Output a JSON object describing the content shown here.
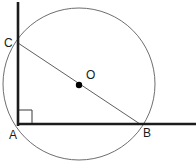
{
  "diagram": {
    "background_color": "#ffffff",
    "stroke_colors": {
      "circle": "#6e6e72",
      "hypotenuse": "#5f5f63",
      "axis_line": "#1c1c1c",
      "right_angle_mark": "#3a3a3e",
      "center_dot": "#000000",
      "label_text": "#1a1a1a"
    },
    "circle": {
      "center_x": 79,
      "center_y": 84,
      "radius": 76
    },
    "center_point": {
      "label": "O",
      "dot_x": 79,
      "dot_y": 85,
      "dot_radius": 3.2,
      "label_x": 86,
      "label_y": 79
    },
    "points": [
      {
        "name": "point-c",
        "label": "C",
        "x": 18,
        "y": 43,
        "label_x": 4,
        "label_y": 47
      },
      {
        "name": "point-a",
        "label": "A",
        "x": 18,
        "y": 124,
        "label_x": 9,
        "label_y": 139
      },
      {
        "name": "point-b",
        "label": "B",
        "x": 140,
        "y": 124,
        "label_x": 143,
        "label_y": 137
      }
    ],
    "lines": {
      "vertical_ray": {
        "name": "vertical-line-through-c-and-a",
        "x1": 18,
        "y1": 2,
        "x2": 18,
        "y2": 127,
        "width": 2.6
      },
      "horizontal_ray": {
        "name": "horizontal-line-through-a-and-b",
        "x1": 17,
        "y1": 124,
        "x2": 196,
        "y2": 124,
        "width": 2.6
      },
      "hypotenuse": {
        "name": "diameter-c-to-b",
        "x1": 18,
        "y1": 43,
        "x2": 140,
        "y2": 124,
        "width": 1.0
      }
    },
    "right_angle_mark": {
      "name": "right-angle-square-at-a",
      "x": 19,
      "y": 110,
      "size": 13,
      "width": 1.0
    }
  }
}
